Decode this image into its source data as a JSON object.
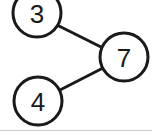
{
  "diagram": {
    "background_color": "#ffffff",
    "stroke_color": "#1a1a1a",
    "node_fill_color": "#ffffff",
    "stroke_width": 3,
    "edge_stroke_width": 3,
    "bottom_rule": {
      "color": "#c8c8c8",
      "width": 1,
      "x1": 0,
      "x2": 152,
      "y": 130
    },
    "nodes": [
      {
        "id": "node-3",
        "label": "3",
        "cx": 37,
        "cy": 13,
        "r": 24
      },
      {
        "id": "node-7",
        "label": "7",
        "cx": 124,
        "cy": 57,
        "r": 24
      },
      {
        "id": "node-4",
        "label": "4",
        "cx": 38,
        "cy": 101,
        "r": 24
      }
    ],
    "edges": [
      {
        "id": "edge-3-7",
        "from": "node-3",
        "to": "node-7",
        "x1": 59,
        "y1": 26,
        "x2": 103,
        "y2": 48
      },
      {
        "id": "edge-4-7",
        "from": "node-4",
        "to": "node-7",
        "x1": 60,
        "y1": 90,
        "x2": 103,
        "y2": 68
      }
    ]
  }
}
